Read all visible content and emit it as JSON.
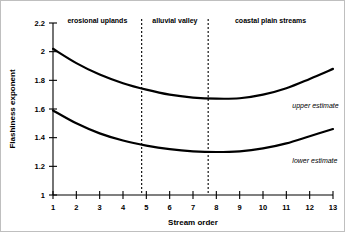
{
  "chart_data": {
    "type": "line",
    "title": "",
    "xlabel": "Stream order",
    "ylabel": "Flashiness exponent",
    "xlim": [
      1,
      13
    ],
    "ylim": [
      1,
      2.2
    ],
    "grid": false,
    "legend_position": "inline-right",
    "x": [
      1,
      2,
      3,
      4,
      5,
      6,
      7,
      8,
      9,
      10,
      11,
      12,
      13
    ],
    "xticks": [
      "1",
      "2",
      "3",
      "4",
      "5",
      "6",
      "7",
      "8",
      "9",
      "10",
      "11",
      "12",
      "13"
    ],
    "yticks": [
      "1",
      "1.2",
      "1.4",
      "1.6",
      "1.8",
      "2",
      "2.2"
    ],
    "ytick_values": [
      1,
      1.2,
      1.4,
      1.6,
      1.8,
      2,
      2.2
    ],
    "series": [
      {
        "name": "upper estimate",
        "label": "upper estimate",
        "values": [
          2.02,
          1.92,
          1.84,
          1.78,
          1.735,
          1.7,
          1.68,
          1.672,
          1.675,
          1.7,
          1.745,
          1.81,
          1.88
        ]
      },
      {
        "name": "lower estimate",
        "label": "lower estimate",
        "values": [
          1.59,
          1.5,
          1.43,
          1.38,
          1.345,
          1.32,
          1.305,
          1.3,
          1.305,
          1.325,
          1.36,
          1.41,
          1.46
        ]
      }
    ],
    "annotations": [
      {
        "text": "erosional uplands",
        "x_range": [
          1,
          4.8
        ]
      },
      {
        "text": "alluvial valley",
        "x_range": [
          4.8,
          7.65
        ]
      },
      {
        "text": "coastal plain streams",
        "x_range": [
          7.65,
          13
        ]
      }
    ],
    "dividers": [
      {
        "x": 4.8
      },
      {
        "x": 7.65
      }
    ],
    "colors": {
      "series_stroke": "#000000",
      "axis": "#000000",
      "background": "#ffffff"
    }
  }
}
